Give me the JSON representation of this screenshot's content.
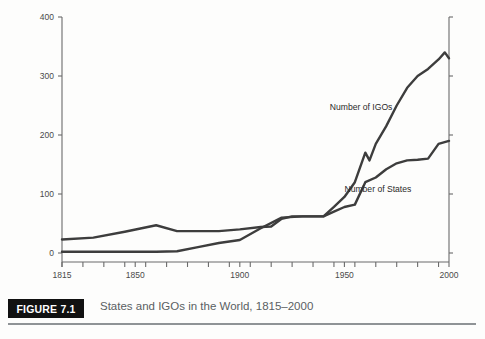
{
  "figure": {
    "badge_label": "FIGURE 7.1",
    "caption": "States and IGOs in the World, 1815–2000"
  },
  "colors": {
    "line": "#3d3d3d",
    "axis": "#6b6b6b",
    "tick_text": "#4a4a4a",
    "badge_bg": "#111111",
    "badge_text": "#ffffff",
    "caption_text": "#5a5f63",
    "rule": "#8f9396"
  },
  "chart_data": {
    "type": "line",
    "title": "States and IGOs in the World, 1815–2000",
    "xlabel": "",
    "ylabel": "",
    "xlim": [
      1815,
      2000
    ],
    "ylim": [
      0,
      400
    ],
    "yticks": [
      0,
      100,
      200,
      300,
      400
    ],
    "ytick_labels": [
      "0",
      "100",
      "200",
      "300",
      "400"
    ],
    "xticks": [
      1815,
      1850,
      1900,
      1950,
      2000
    ],
    "xtick_labels": [
      "1815",
      "1850",
      "1900",
      "1950",
      "2000"
    ],
    "xminor_step": 10,
    "grid": false,
    "legend": "inline-annotations",
    "annotations": [
      {
        "text": "Number of IGOs",
        "x": 1958,
        "y": 243
      },
      {
        "text": "Number of States",
        "x": 1966,
        "y": 104
      }
    ],
    "series": [
      {
        "name": "Number of IGOs",
        "x": [
          1815,
          1830,
          1845,
          1860,
          1870,
          1880,
          1890,
          1900,
          1910,
          1915,
          1920,
          1925,
          1930,
          1940,
          1945,
          1950,
          1955,
          1960,
          1962,
          1965,
          1970,
          1975,
          1980,
          1985,
          1990,
          1995,
          1998,
          2000
        ],
        "values": [
          23,
          26,
          36,
          47,
          37,
          37,
          37,
          40,
          44,
          45,
          58,
          62,
          62,
          62,
          78,
          95,
          120,
          170,
          157,
          185,
          215,
          250,
          280,
          300,
          312,
          328,
          340,
          330
        ]
      },
      {
        "name": "Number of States",
        "x": [
          1815,
          1840,
          1860,
          1870,
          1880,
          1890,
          1900,
          1910,
          1920,
          1930,
          1940,
          1945,
          1950,
          1955,
          1960,
          1965,
          1970,
          1975,
          1980,
          1985,
          1990,
          1995,
          2000
        ],
        "values": [
          2,
          2,
          2,
          3,
          10,
          17,
          22,
          42,
          60,
          62,
          62,
          70,
          78,
          82,
          120,
          128,
          142,
          152,
          157,
          158,
          160,
          185,
          190
        ]
      }
    ]
  }
}
